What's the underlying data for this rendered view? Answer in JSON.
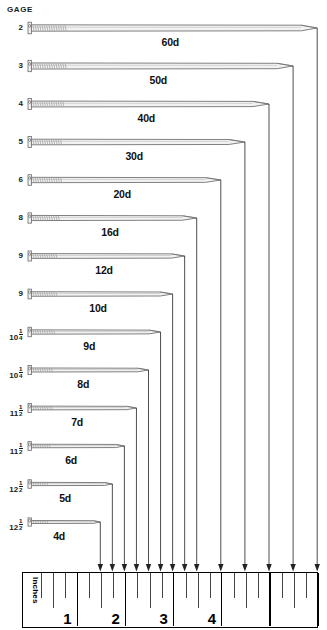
{
  "header": {
    "gage_label": "GAGE"
  },
  "chart_data": {
    "type": "bar",
    "xlabel": "Inches",
    "ylabel": "GAGE",
    "xlim": [
      0,
      6
    ],
    "grid": false,
    "legend": false,
    "orientation": "horizontal",
    "categories": [
      "60d",
      "50d",
      "40d",
      "30d",
      "20d",
      "16d",
      "12d",
      "10d",
      "9d",
      "8d",
      "7d",
      "6d",
      "5d",
      "4d"
    ],
    "values": [
      6.0,
      5.5,
      5.0,
      4.5,
      4.0,
      3.5,
      3.25,
      3.0,
      2.75,
      2.5,
      2.25,
      2.0,
      1.75,
      1.5
    ],
    "series": [
      {
        "name": "Nail length (inches)",
        "values": [
          6.0,
          5.5,
          5.0,
          4.5,
          4.0,
          3.5,
          3.25,
          3.0,
          2.75,
          2.5,
          2.25,
          2.0,
          1.75,
          1.5
        ]
      }
    ],
    "gages": [
      "2",
      "3",
      "4",
      "5",
      "6",
      "8",
      "9",
      "9",
      "10 1/4",
      "10 1/4",
      "11 1/2",
      "11 1/2",
      "12 1/2",
      "12 1/2"
    ],
    "tick_labels": [
      "1",
      "2",
      "3",
      "4"
    ],
    "annotations": [
      "Inches",
      "GAGE"
    ]
  },
  "rows": [
    {
      "gage": "2",
      "gage_whole": "2",
      "gage_num": "",
      "gage_den": "",
      "size": "60d",
      "length_in": 6.0
    },
    {
      "gage": "3",
      "gage_whole": "3",
      "gage_num": "",
      "gage_den": "",
      "size": "50d",
      "length_in": 5.5
    },
    {
      "gage": "4",
      "gage_whole": "4",
      "gage_num": "",
      "gage_den": "",
      "size": "40d",
      "length_in": 5.0
    },
    {
      "gage": "5",
      "gage_whole": "5",
      "gage_num": "",
      "gage_den": "",
      "size": "30d",
      "length_in": 4.5
    },
    {
      "gage": "6",
      "gage_whole": "6",
      "gage_num": "",
      "gage_den": "",
      "size": "20d",
      "length_in": 4.0
    },
    {
      "gage": "8",
      "gage_whole": "8",
      "gage_num": "",
      "gage_den": "",
      "size": "16d",
      "length_in": 3.5
    },
    {
      "gage": "9",
      "gage_whole": "9",
      "gage_num": "",
      "gage_den": "",
      "size": "12d",
      "length_in": 3.25
    },
    {
      "gage": "9",
      "gage_whole": "9",
      "gage_num": "",
      "gage_den": "",
      "size": "10d",
      "length_in": 3.0
    },
    {
      "gage": "10 1/4",
      "gage_whole": "10",
      "gage_num": "1",
      "gage_den": "4",
      "size": "9d",
      "length_in": 2.75
    },
    {
      "gage": "10 1/4",
      "gage_whole": "10",
      "gage_num": "1",
      "gage_den": "4",
      "size": "8d",
      "length_in": 2.5
    },
    {
      "gage": "11 1/2",
      "gage_whole": "11",
      "gage_num": "1",
      "gage_den": "2",
      "size": "7d",
      "length_in": 2.25
    },
    {
      "gage": "11 1/2",
      "gage_whole": "11",
      "gage_num": "1",
      "gage_den": "2",
      "size": "6d",
      "length_in": 2.0
    },
    {
      "gage": "12 1/2",
      "gage_whole": "12",
      "gage_num": "1",
      "gage_den": "2",
      "size": "5d",
      "length_in": 1.75
    },
    {
      "gage": "12 1/2",
      "gage_whole": "12",
      "gage_num": "1",
      "gage_den": "2",
      "size": "4d",
      "length_in": 1.5
    }
  ],
  "ruler": {
    "unit_word": "Inches",
    "numbers": [
      "1",
      "2",
      "3",
      "4"
    ],
    "divisions": 6,
    "subticks_per_inch": 4
  },
  "colors": {
    "ink": "#111111",
    "nail_outline": "#6b6b6b",
    "nail_fill": "#f2f2f2",
    "rule_line": "#000000",
    "arrow": "#222222",
    "background": "#ffffff"
  }
}
